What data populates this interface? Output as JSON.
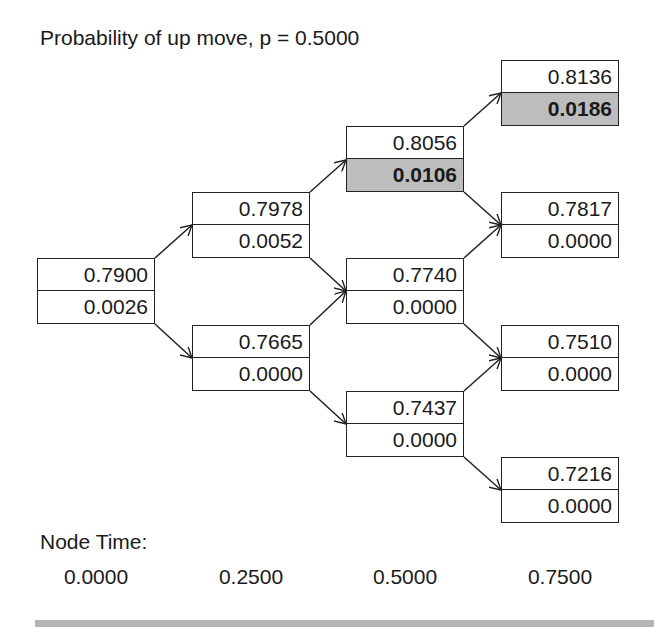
{
  "header": {
    "title": "Probability of up move, p = 0.5000"
  },
  "tree": {
    "columns": [
      {
        "time": "0.0000",
        "nodes": [
          {
            "value": "0.7900",
            "second": "0.0026",
            "highlight": false
          }
        ]
      },
      {
        "time": "0.2500",
        "nodes": [
          {
            "value": "0.7978",
            "second": "0.0052",
            "highlight": false
          },
          {
            "value": "0.7665",
            "second": "0.0000",
            "highlight": false
          }
        ]
      },
      {
        "time": "0.5000",
        "nodes": [
          {
            "value": "0.8056",
            "second": "0.0106",
            "highlight": true
          },
          {
            "value": "0.7740",
            "second": "0.0000",
            "highlight": false
          },
          {
            "value": "0.7437",
            "second": "0.0000",
            "highlight": false
          }
        ]
      },
      {
        "time": "0.7500",
        "nodes": [
          {
            "value": "0.8136",
            "second": "0.0186",
            "highlight": true
          },
          {
            "value": "0.7817",
            "second": "0.0000",
            "highlight": false
          },
          {
            "value": "0.7510",
            "second": "0.0000",
            "highlight": false
          },
          {
            "value": "0.7216",
            "second": "0.0000",
            "highlight": false
          }
        ]
      }
    ]
  },
  "footer": {
    "node_time_label": "Node Time:",
    "times": [
      "0.0000",
      "0.2500",
      "0.5000",
      "0.7500"
    ]
  },
  "colors": {
    "highlight_fill": "#bdbdbd",
    "border": "#222222",
    "divider": "#b4b4b4"
  }
}
